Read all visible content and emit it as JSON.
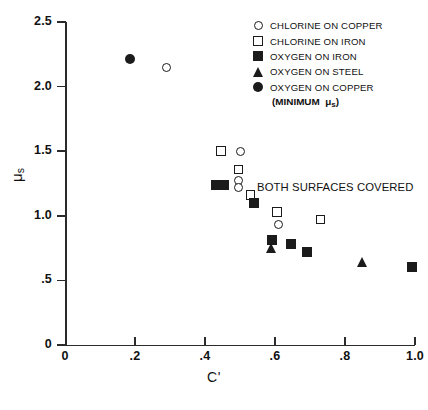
{
  "chart_data": {
    "type": "scatter",
    "title": "",
    "xlabel": "C'",
    "ylabel": "μs",
    "xlim": [
      0,
      1.0
    ],
    "ylim": [
      0,
      2.5
    ],
    "xticks": [
      "0",
      ".2",
      ".4",
      ".6",
      ".8",
      "1.0"
    ],
    "xtick_values": [
      0,
      0.2,
      0.4,
      0.6,
      0.8,
      1.0
    ],
    "yticks": [
      "0",
      ".5",
      "1.0",
      "1.5",
      "2.0",
      "2.5"
    ],
    "ytick_values": [
      0,
      0.5,
      1.0,
      1.5,
      2.0,
      2.5
    ],
    "grid": false,
    "legend_position": "top-right",
    "annotations": [
      {
        "text": "BOTH SURFACES COVERED",
        "x": 0.55,
        "y": 1.27
      }
    ],
    "series": [
      {
        "name": "CHLORINE ON COPPER",
        "marker": "open-circle",
        "points": [
          {
            "x": 0.29,
            "y": 2.15
          },
          {
            "x": 0.5,
            "y": 1.5
          },
          {
            "x": 0.495,
            "y": 1.27
          },
          {
            "x": 0.495,
            "y": 1.22
          },
          {
            "x": 0.61,
            "y": 0.93
          }
        ]
      },
      {
        "name": "CHLORINE ON IRON",
        "marker": "open-square",
        "points": [
          {
            "x": 0.445,
            "y": 1.5
          },
          {
            "x": 0.495,
            "y": 1.36
          },
          {
            "x": 0.53,
            "y": 1.16
          },
          {
            "x": 0.605,
            "y": 1.03
          },
          {
            "x": 0.73,
            "y": 0.97
          }
        ]
      },
      {
        "name": "OXYGEN ON IRON",
        "marker": "filled-square",
        "points": [
          {
            "x": 0.43,
            "y": 1.24
          },
          {
            "x": 0.455,
            "y": 1.24
          },
          {
            "x": 0.54,
            "y": 1.1
          },
          {
            "x": 0.59,
            "y": 0.81
          },
          {
            "x": 0.645,
            "y": 0.78
          },
          {
            "x": 0.69,
            "y": 0.72
          },
          {
            "x": 0.99,
            "y": 0.6
          }
        ]
      },
      {
        "name": "OXYGEN ON STEEL",
        "marker": "filled-triangle",
        "points": [
          {
            "x": 0.59,
            "y": 0.75
          },
          {
            "x": 0.85,
            "y": 0.64
          }
        ]
      },
      {
        "name": "OXYGEN ON COPPER",
        "marker": "filled-circle",
        "points": [
          {
            "x": 0.185,
            "y": 2.21
          }
        ]
      }
    ],
    "legend": [
      {
        "label": "CHLORINE ON COPPER",
        "marker": "open-circle"
      },
      {
        "label": "CHLORINE ON IRON",
        "marker": "open-square"
      },
      {
        "label": "OXYGEN ON IRON",
        "marker": "filled-square"
      },
      {
        "label": "OXYGEN ON STEEL",
        "marker": "filled-triangle"
      },
      {
        "label": "OXYGEN ON COPPER",
        "marker": "filled-circle"
      }
    ],
    "legend_note": "(MINIMUM μs)"
  }
}
